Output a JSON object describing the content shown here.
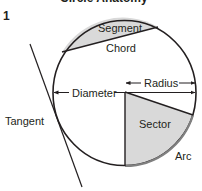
{
  "figure": {
    "number": "1",
    "cut_off_header": "Circle Anatomy"
  },
  "labels": {
    "segment": "Segment",
    "chord": "Chord",
    "radius": "Radius",
    "diameter": "Diameter",
    "tangent": "Tangent",
    "sector": "Sector",
    "arc": "Arc"
  },
  "colors": {
    "stroke": "#231f20",
    "fill_shaded": "#d9d9d9",
    "arc_stroke": "#808080",
    "background": "#ffffff"
  }
}
